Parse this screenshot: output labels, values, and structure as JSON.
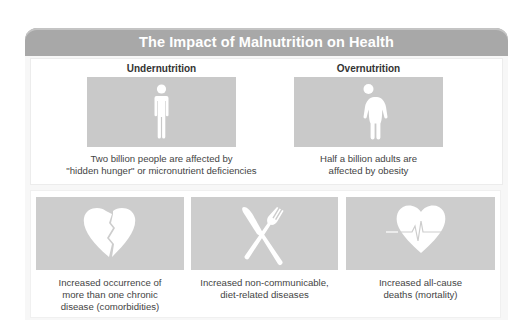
{
  "title": "The Impact of Malnutrition on Health",
  "top": [
    {
      "heading": "Undernutrition",
      "icon": "thin-person-icon",
      "caption_lines": [
        "Two billion people are affected by",
        "\"hidden hunger\" or micronutrient deficiencies"
      ]
    },
    {
      "heading": "Overnutrition",
      "icon": "obese-person-icon",
      "caption_lines": [
        "Half a billion adults are",
        "affected by obesity"
      ]
    }
  ],
  "bottom": [
    {
      "icon": "broken-heart-icon",
      "caption_lines": [
        "Increased occurrence of",
        "more than one chronic",
        "disease (comorbidities)"
      ]
    },
    {
      "icon": "knife-fork-icon",
      "caption_lines": [
        "Increased non-communicable,",
        "diet-related diseases"
      ]
    },
    {
      "icon": "heart-pulse-icon",
      "caption_lines": [
        "Increased all-cause",
        "deaths (mortality)"
      ]
    }
  ],
  "colors": {
    "header": "#a8a8a8",
    "box": "#c9c9c9",
    "icon": "#ffffff"
  }
}
